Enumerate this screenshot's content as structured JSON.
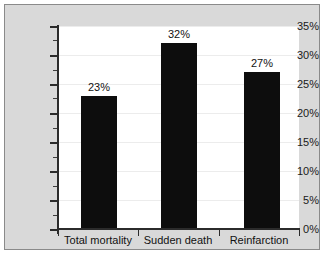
{
  "chart_data": {
    "type": "bar",
    "title": "",
    "xlabel": "",
    "ylabel": "",
    "categories": [
      "Total mortality",
      "Sudden death",
      "Reinfarction"
    ],
    "values": [
      23,
      32,
      27
    ],
    "value_labels": [
      "23%",
      "32%",
      "27%"
    ],
    "ylim": [
      0,
      35
    ],
    "ytick_values": [
      0,
      5,
      10,
      15,
      20,
      25,
      30,
      35
    ],
    "ytick_labels": [
      "0%",
      "5%",
      "10%",
      "15%",
      "20%",
      "25%",
      "30%",
      "35%"
    ],
    "minor_tick_step": 2.5,
    "grid": true,
    "legend": "none",
    "bar_color": "#0d0d0d",
    "plot_background": "#ffffff",
    "figure_background": "#d9d9d9",
    "axis_color": "#2b2b2b",
    "grid_color": "#ececec"
  }
}
